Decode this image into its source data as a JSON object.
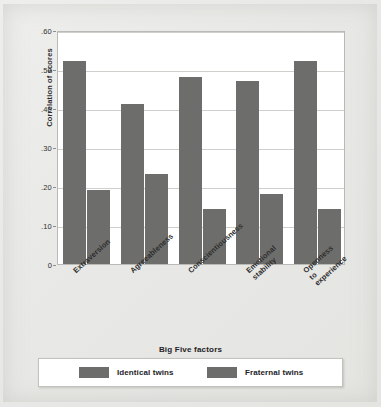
{
  "chart_data": {
    "type": "bar",
    "title": "",
    "xlabel": "Big Five factors",
    "ylabel": "Correlation of scores",
    "categories": [
      "Extraversion",
      "Agreeableness",
      "Conscientiousness",
      "Emotional\nstability",
      "Openness\nto\nexperience"
    ],
    "series": [
      {
        "name": "Identical twins",
        "values": [
          0.52,
          0.41,
          0.48,
          0.47,
          0.52
        ]
      },
      {
        "name": "Fraternal twins",
        "values": [
          0.19,
          0.23,
          0.14,
          0.18,
          0.14
        ]
      }
    ],
    "ylim": [
      0,
      0.6
    ],
    "ytick_labels": [
      ".60",
      ".50",
      ".40",
      ".30",
      ".20",
      ".10",
      "0"
    ],
    "ytick_values": [
      0.6,
      0.5,
      0.4,
      0.3,
      0.2,
      0.1,
      0
    ],
    "grid": true,
    "legend_position": "bottom",
    "colors": {
      "bar": "#6d6d6b",
      "plot_background": "#ffffff",
      "page_background": "#e9e9e7",
      "gridline": "#cfcfcc"
    }
  },
  "legend": {
    "identical_label": "Identical twins",
    "fraternal_label": "Fraternal twins"
  }
}
